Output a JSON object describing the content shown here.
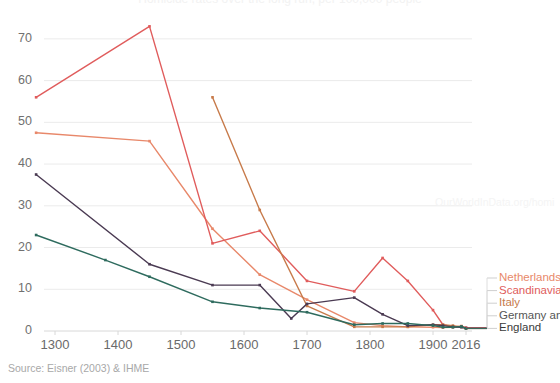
{
  "chart_data": {
    "type": "line",
    "title": "Homicide rates over the long run, per 100,000 people",
    "xlabel": "",
    "ylabel": "",
    "ylim": [
      0,
      75
    ],
    "yticks": [
      0,
      10,
      20,
      30,
      40,
      50,
      60,
      70
    ],
    "xticks": [
      "1300",
      "1400",
      "1500",
      "1600",
      "1700",
      "1800",
      "1900",
      "2016"
    ],
    "xtick_values": [
      1300,
      1400,
      1500,
      1600,
      1700,
      1800,
      1900,
      2016
    ],
    "grid": "horizontal",
    "legend_position": "right",
    "series": [
      {
        "name": "Netherlands",
        "color": "#e8886a",
        "x": [
          1270,
          1450,
          1550,
          1625,
          1700,
          1775,
          1820,
          1860,
          1900,
          1935,
          1970,
          2000,
          2016
        ],
        "values": [
          47.5,
          45.5,
          24.5,
          13.5,
          7.5,
          2.0,
          1.3,
          1.0,
          0.9,
          0.8,
          0.9,
          1.2,
          0.7
        ]
      },
      {
        "name": "Scandinavia",
        "color": "#e05c5c",
        "x": [
          1270,
          1450,
          1550,
          1625,
          1700,
          1775,
          1820,
          1860,
          1900,
          1935,
          1970,
          2000,
          2016
        ],
        "values": [
          56.0,
          73.0,
          21.0,
          24.0,
          12.0,
          9.5,
          17.5,
          12.0,
          5.0,
          1.5,
          1.0,
          1.0,
          0.8
        ]
      },
      {
        "name": "Italy",
        "color": "#c77a4a",
        "x": [
          1550,
          1625,
          1700,
          1775,
          1820,
          1860,
          1900,
          1935,
          1970,
          2000,
          2016
        ],
        "values": [
          56.0,
          29.0,
          6.0,
          1.0,
          1.0,
          1.0,
          1.5,
          1.5,
          1.3,
          1.0,
          0.6
        ]
      },
      {
        "name": "Germany and Switzerland",
        "color": "#4a3a52",
        "x": [
          1270,
          1450,
          1550,
          1625,
          1675,
          1700,
          1775,
          1820,
          1860,
          1900,
          1935,
          1970,
          2000,
          2016
        ],
        "values": [
          37.5,
          16.0,
          11.0,
          11.0,
          3.0,
          6.5,
          8.0,
          4.0,
          1.3,
          1.5,
          1.3,
          1.0,
          0.9,
          0.7
        ]
      },
      {
        "name": "England",
        "color": "#2e6b5e",
        "x": [
          1270,
          1380,
          1450,
          1550,
          1625,
          1700,
          1775,
          1820,
          1860,
          1900,
          1935,
          1970,
          2000,
          2016
        ],
        "values": [
          23.0,
          17.0,
          13.0,
          7.0,
          5.5,
          4.5,
          1.5,
          1.8,
          1.8,
          1.3,
          0.9,
          0.9,
          1.1,
          0.6
        ]
      }
    ]
  },
  "legend": {
    "items": [
      {
        "label": "Netherlands",
        "color": "#e8886a"
      },
      {
        "label": "Scandinavia",
        "color": "#e05c5c"
      },
      {
        "label": "Italy",
        "color": "#c77a4a"
      },
      {
        "label": "Germany an",
        "color": "#555555"
      },
      {
        "label": "England",
        "color": "#3a3a3a"
      }
    ]
  },
  "footer": {
    "source": "Source: Eisner (2003) & IHME",
    "watermark": "OurWorldInData.org/homi"
  }
}
